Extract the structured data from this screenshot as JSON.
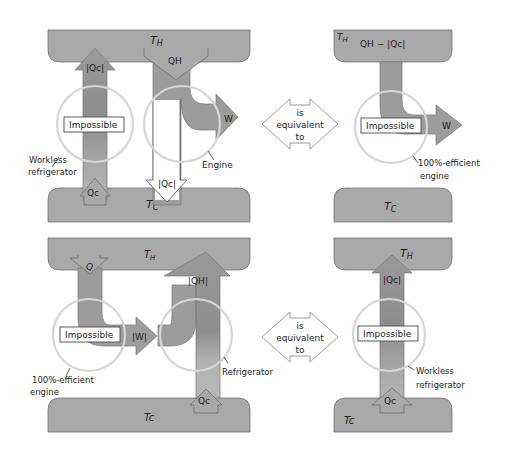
{
  "colors": {
    "reservoir": "#a9a9a9",
    "reservoir_stroke": "#6f6f6f",
    "flow": "#9c9c9c",
    "flow_dark": "#8a8a8a",
    "flow_light": "#b8b8b8",
    "circle": "#d6d6d6",
    "background": "#ffffff"
  },
  "top_left": {
    "hot_reservoir": "T_H",
    "cold_reservoir": "T_C",
    "refrigerator_up_label": "|Qc|",
    "refrigerator_in_label": "Qc",
    "engine_in_label": "QH",
    "engine_work_label": "W",
    "engine_out_label": "|Qc|",
    "impossible_label": "Impossible",
    "workless_refrigerator_caption": [
      "Workless",
      "refrigerator"
    ],
    "engine_caption": "Engine"
  },
  "top_equiv": [
    "is",
    "equivalent",
    "to"
  ],
  "top_right": {
    "hot_reservoir": "T_H",
    "flow_label": "QH − |Qc|",
    "cold_reservoir": "T_C",
    "work_label": "W",
    "impossible_label": "Impossible",
    "caption": [
      "100%-efficient",
      "engine"
    ]
  },
  "bottom_left": {
    "hot_reservoir": "T_H",
    "cold_reservoir": "Tc",
    "engine_in_label": "Q",
    "work_label": "|W|",
    "refrigerator_out_label": "|QH|",
    "refrigerator_in_label": "Qc",
    "impossible_label": "Impossible",
    "engine_caption": [
      "100%-efficient",
      "engine"
    ],
    "refrigerator_caption": "Refrigerator"
  },
  "bottom_equiv": [
    "is",
    "equivalent",
    "to"
  ],
  "bottom_right": {
    "hot_reservoir": "T_H",
    "cold_reservoir": "Tc",
    "up_label": "|Qc|",
    "in_label": "Qc",
    "impossible_label": "Impossible",
    "caption": [
      "Workless",
      "refrigerator"
    ]
  }
}
